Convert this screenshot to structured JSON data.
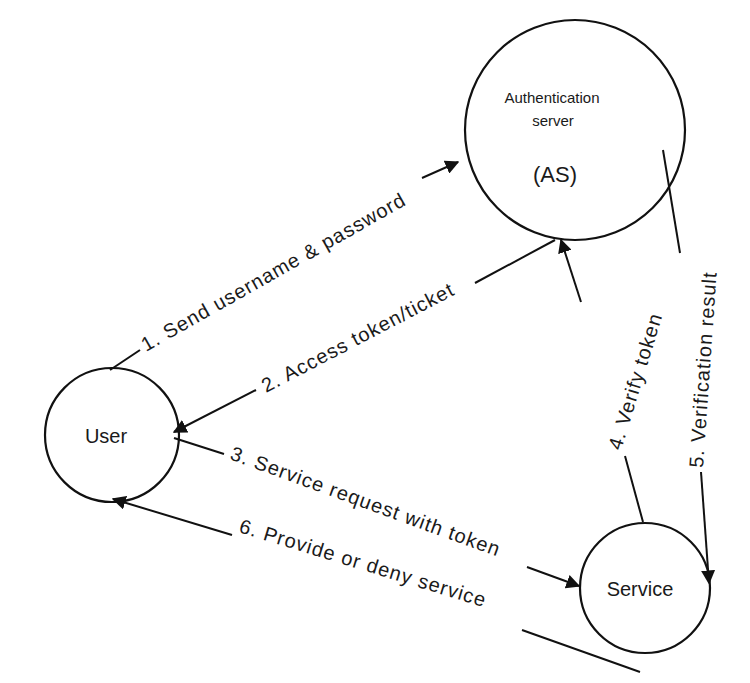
{
  "diagram": {
    "type": "authentication-flow",
    "nodes": {
      "as": {
        "title_line1": "Authentication",
        "title_line2": "server",
        "abbr": "(AS)"
      },
      "user": {
        "label": "User"
      },
      "service": {
        "label": "Service"
      }
    },
    "edges": [
      {
        "step": 1,
        "label": "1. Send username & password",
        "from": "User",
        "to": "Authentication server (AS)"
      },
      {
        "step": 2,
        "label": "2. Access token/ticket",
        "from": "Authentication server (AS)",
        "to": "User"
      },
      {
        "step": 3,
        "label": "3. Service request with token",
        "from": "User",
        "to": "Service"
      },
      {
        "step": 4,
        "label": "4. Verify token",
        "from": "Service",
        "to": "Authentication server (AS)"
      },
      {
        "step": 5,
        "label": "5. Verification result",
        "from": "Authentication server (AS)",
        "to": "Service"
      },
      {
        "step": 6,
        "label": "6. Provide or deny service",
        "from": "Service",
        "to": "User"
      }
    ],
    "colors": {
      "stroke": "#111111",
      "background": "#ffffff",
      "text": "#1a1a1a"
    }
  }
}
